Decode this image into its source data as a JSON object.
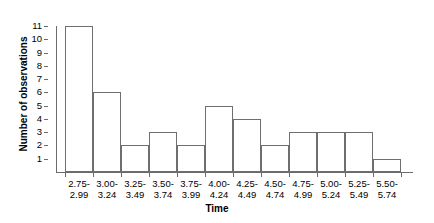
{
  "chart_data": {
    "type": "bar",
    "title": "",
    "subtitle": "",
    "xlabel": "Time",
    "ylabel": "Number of observations",
    "categories": [
      "2.75-\n2.99",
      "3.00-\n3.24",
      "3.25-\n3.49",
      "3.50-\n3.74",
      "3.75-\n3.99",
      "4.00-\n4.24",
      "4.25-\n4.49",
      "4.50-\n4.74",
      "4.75-\n4.99",
      "5.00-\n5.24",
      "5.25-\n5.49",
      "5.50-\n5.74"
    ],
    "values": [
      11,
      6,
      2,
      3,
      2,
      5,
      4,
      2,
      3,
      3,
      3,
      1
    ],
    "ylim": [
      0,
      11
    ],
    "yticks": [
      1,
      2,
      3,
      4,
      5,
      6,
      7,
      8,
      9,
      10,
      11
    ],
    "grid": false,
    "legend": false,
    "legend_position": "none",
    "bar_fill_color": "#ffffff",
    "bar_edge_color": "#6f6f6f",
    "axis_color": "#6b6b6b",
    "text_color": "#000000",
    "background_color": "#ffffff"
  }
}
